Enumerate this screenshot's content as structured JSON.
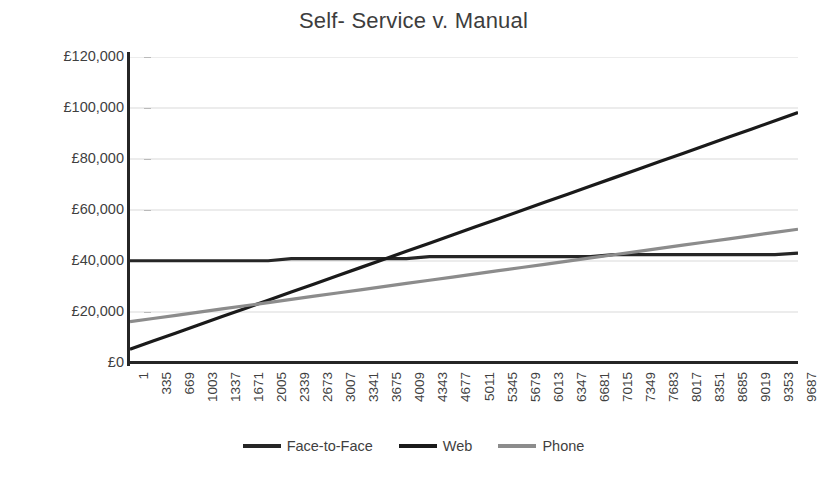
{
  "chart_data": {
    "type": "line",
    "title": "Self- Service v. Manual",
    "xlabel": "",
    "ylabel": "",
    "ylim": [
      0,
      120000
    ],
    "y_ticks": [
      0,
      20000,
      40000,
      60000,
      80000,
      100000,
      120000
    ],
    "y_tick_labels": [
      "£0",
      "£20,000",
      "£40,000",
      "£60,000",
      "£80,000",
      "£100,000",
      "£120,000"
    ],
    "grid": "horizontal",
    "legend_position": "bottom",
    "x": [
      1,
      335,
      669,
      1003,
      1337,
      1671,
      2005,
      2339,
      2673,
      3007,
      3341,
      3675,
      4009,
      4343,
      4677,
      5011,
      5345,
      5679,
      6013,
      6347,
      6681,
      7015,
      7349,
      7683,
      8017,
      8351,
      8685,
      9019,
      9353,
      9687
    ],
    "x_tick_labels": [
      "1",
      "335",
      "669",
      "1003",
      "1337",
      "1671",
      "2005",
      "2339",
      "2673",
      "3007",
      "3341",
      "3675",
      "4009",
      "4343",
      "4677",
      "5011",
      "5345",
      "5679",
      "6013",
      "6347",
      "6681",
      "7015",
      "7349",
      "7683",
      "8017",
      "8351",
      "8685",
      "9019",
      "9353",
      "9687"
    ],
    "series": [
      {
        "name": "Face-to-Face",
        "color": "#262626",
        "values": [
          40100,
          40100,
          40100,
          40100,
          40100,
          40100,
          40100,
          40900,
          40900,
          40900,
          40900,
          40900,
          40900,
          41700,
          41700,
          41700,
          41700,
          41700,
          41700,
          41700,
          41700,
          42500,
          42500,
          42500,
          42500,
          42500,
          42500,
          42500,
          42500,
          43100
        ]
      },
      {
        "name": "Web",
        "color": "#1a1a1a",
        "values": [
          5400,
          8600,
          11800,
          15000,
          18200,
          21400,
          24600,
          27800,
          31000,
          34200,
          37400,
          40600,
          43800,
          47000,
          50200,
          53400,
          56600,
          59800,
          63000,
          66200,
          69400,
          72600,
          75800,
          79000,
          82200,
          85400,
          88600,
          91800,
          95000,
          98200
        ]
      },
      {
        "name": "Phone",
        "color": "#8c8c8c",
        "values": [
          16200,
          17450,
          18700,
          19950,
          21200,
          22450,
          23700,
          24950,
          26200,
          27450,
          28700,
          29950,
          31200,
          32450,
          33700,
          34950,
          36200,
          37450,
          38700,
          39950,
          41200,
          42450,
          43700,
          44950,
          46200,
          47450,
          48700,
          49950,
          51200,
          52450
        ]
      }
    ]
  },
  "legend": {
    "items": [
      {
        "label": "Face-to-Face",
        "color": "#262626"
      },
      {
        "label": "Web",
        "color": "#1a1a1a"
      },
      {
        "label": "Phone",
        "color": "#8c8c8c"
      }
    ]
  },
  "colors": {
    "grid": "#d9d9d9",
    "axis": "#262626",
    "text": "#3f3f3f",
    "background": "#ffffff"
  }
}
